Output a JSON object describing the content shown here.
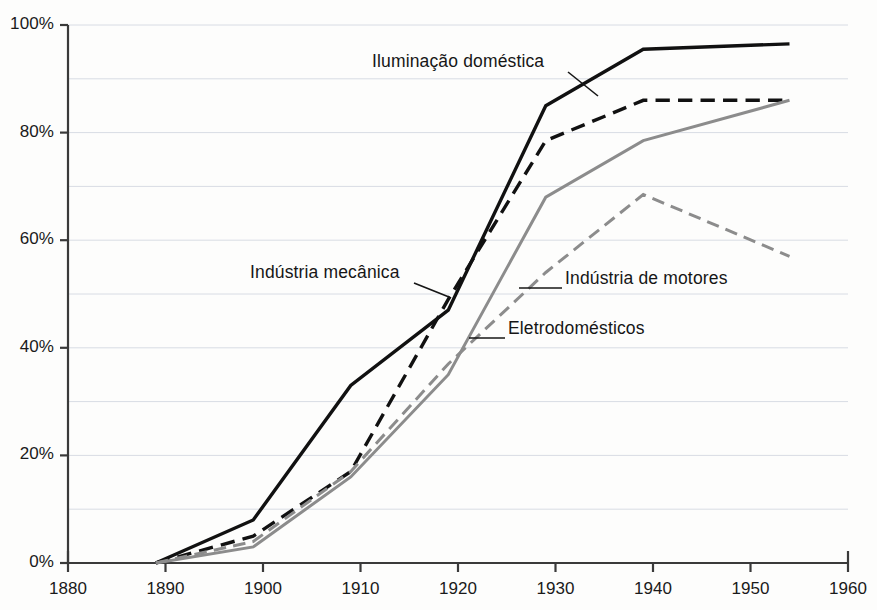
{
  "chart_data": {
    "type": "line",
    "title": "",
    "subtitle": "",
    "xlabel": "",
    "ylabel": "",
    "xlim": [
      1880,
      1960
    ],
    "ylim": [
      0,
      100
    ],
    "grid": true,
    "grid_step": 10,
    "legend_position": "inline-annotations",
    "x_ticks": [
      1880,
      1890,
      1900,
      1910,
      1920,
      1930,
      1940,
      1950,
      1960
    ],
    "x_tick_labels": [
      "1880",
      "1890",
      "1900",
      "1910",
      "1920",
      "1930",
      "1940",
      "1950",
      "1960"
    ],
    "y_ticks": [
      0,
      20,
      40,
      60,
      80,
      100
    ],
    "y_tick_labels": [
      "0%",
      "20%",
      "40%",
      "60%",
      "80%",
      "100%"
    ],
    "series": [
      {
        "name": "Iluminação doméstica",
        "color": "#111111",
        "style": "solid",
        "width": 3.4,
        "x": [
          1889,
          1899,
          1909,
          1919,
          1929,
          1939,
          1954
        ],
        "values": [
          0,
          8,
          33,
          47,
          85,
          95.5,
          96.5
        ]
      },
      {
        "name": "Indústria mecânica",
        "color": "#111111",
        "style": "dashed",
        "width": 3.4,
        "x": [
          1889,
          1899,
          1909,
          1919,
          1929,
          1939,
          1954
        ],
        "values": [
          0,
          5,
          17,
          49,
          78.5,
          86,
          86
        ]
      },
      {
        "name": "Eletrodomésticos",
        "color": "#8c8c8c",
        "style": "solid",
        "width": 3.0,
        "x": [
          1889,
          1899,
          1909,
          1919,
          1929,
          1939,
          1954
        ],
        "values": [
          0,
          3,
          16,
          35,
          68,
          78.5,
          86
        ]
      },
      {
        "name": "Indústria de motores",
        "color": "#8c8c8c",
        "style": "dashed",
        "width": 3.0,
        "x": [
          1889,
          1899,
          1909,
          1919,
          1929,
          1939,
          1954
        ],
        "values": [
          0,
          4,
          17,
          37,
          54,
          68.5,
          57
        ]
      }
    ],
    "annotations": [
      {
        "text": "Iluminação doméstica",
        "label_x": 372,
        "label_y": 51,
        "leader_from": [
          568,
          72
        ],
        "leader_to": [
          598,
          96
        ]
      },
      {
        "text": "Indústria mecânica",
        "label_x": 250,
        "label_y": 262,
        "leader_from": [
          414,
          283
        ],
        "leader_to": [
          449,
          297
        ]
      },
      {
        "text": "Indústria de motores",
        "label_x": 565,
        "label_y": 268,
        "leader_from": [
          562,
          288
        ],
        "leader_to": [
          519,
          288
        ]
      },
      {
        "text": "Eletrodomésticos",
        "label_x": 508,
        "label_y": 318,
        "leader_from": [
          505,
          338
        ],
        "leader_to": [
          469,
          338
        ]
      }
    ]
  },
  "axes": {
    "plot_left": 68,
    "plot_right": 848,
    "plot_top": 25,
    "plot_bottom": 563,
    "axis_color": "#3a3a3a",
    "grid_color": "#d8dce4"
  }
}
